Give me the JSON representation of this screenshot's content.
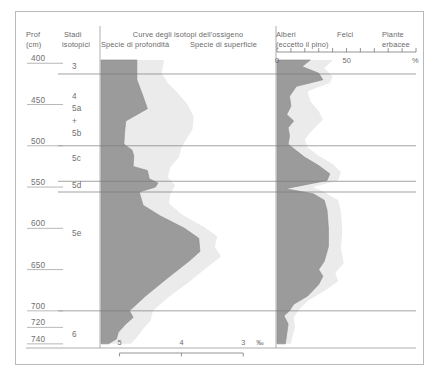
{
  "figure": {
    "columns": {
      "depth_header_line1": "Prof",
      "depth_header_line2": "(cm)",
      "stage_header_line1": "Stadi",
      "stage_header_line2": "isotopici",
      "isotope_title": "Curve degli isotopi dell'ossigeno",
      "isotope_sub_left": "Specie di profondità",
      "isotope_sub_right": "Specie di superficie",
      "pollen_header_1_line1": "Alberi",
      "pollen_header_1_line2": "(eccetto il pino)",
      "pollen_header_2": "Felci",
      "pollen_header_3_line1": "Piante",
      "pollen_header_3_line2": "erbacee"
    },
    "depth_labels": [
      "400",
      "450",
      "500",
      "550",
      "600",
      "650",
      "700",
      "720",
      "740"
    ],
    "stage_labels": [
      "3",
      "4",
      "5a",
      "+",
      "5b",
      "5c",
      "5d",
      "5e",
      "6"
    ],
    "isotope_axis": {
      "labels": [
        "5",
        "4",
        "3"
      ],
      "unit": "‰",
      "position": "bottom"
    },
    "pollen_axis": {
      "labels": [
        "0",
        "50"
      ],
      "unit": "%",
      "position": "top"
    },
    "colors": {
      "deep_species_fill": "#9b9b9b",
      "surface_species_fill": "#ebebeb",
      "frame": "#b9b9b9",
      "rule": "#7a7a7a",
      "text": "#6a6a6a"
    }
  },
  "chart_data": {
    "type": "area",
    "title": "Curve degli isotopi dell'ossigeno",
    "ylabel": "Prof (cm)",
    "ylim": [
      390,
      745
    ],
    "grid": false,
    "legend": "none",
    "panels": [
      {
        "name": "isotopi",
        "xlabel": "‰",
        "xlim": [
          5.3,
          2.6
        ],
        "xticks": [
          5,
          4,
          3
        ],
        "series": [
          {
            "name": "Specie di profondità",
            "fill": "#9b9b9b",
            "points": [
              {
                "depth": 396,
                "value": 4.72
              },
              {
                "depth": 420,
                "value": 4.72
              },
              {
                "depth": 440,
                "value": 4.62
              },
              {
                "depth": 455,
                "value": 4.55
              },
              {
                "depth": 470,
                "value": 4.9
              },
              {
                "depth": 485,
                "value": 4.92
              },
              {
                "depth": 498,
                "value": 4.93
              },
              {
                "depth": 505,
                "value": 4.8
              },
              {
                "depth": 512,
                "value": 4.77
              },
              {
                "depth": 525,
                "value": 4.78
              },
              {
                "depth": 530,
                "value": 4.55
              },
              {
                "depth": 540,
                "value": 4.52
              },
              {
                "depth": 545,
                "value": 4.38
              },
              {
                "depth": 550,
                "value": 4.42
              },
              {
                "depth": 556,
                "value": 4.68
              },
              {
                "depth": 562,
                "value": 4.66
              },
              {
                "depth": 572,
                "value": 4.62
              },
              {
                "depth": 585,
                "value": 4.34
              },
              {
                "depth": 600,
                "value": 3.95
              },
              {
                "depth": 612,
                "value": 3.72
              },
              {
                "depth": 628,
                "value": 3.7
              },
              {
                "depth": 640,
                "value": 3.88
              },
              {
                "depth": 660,
                "value": 4.22
              },
              {
                "depth": 682,
                "value": 4.58
              },
              {
                "depth": 700,
                "value": 4.84
              },
              {
                "depth": 708,
                "value": 4.78
              },
              {
                "depth": 716,
                "value": 4.9
              },
              {
                "depth": 726,
                "value": 5.02
              },
              {
                "depth": 734,
                "value": 5.05
              },
              {
                "depth": 740,
                "value": 5.18
              }
            ]
          },
          {
            "name": "Specie di superficie",
            "fill": "#ebebeb",
            "points": [
              {
                "depth": 396,
                "value": 4.28
              },
              {
                "depth": 412,
                "value": 4.32
              },
              {
                "depth": 424,
                "value": 4.22
              },
              {
                "depth": 436,
                "value": 4.06
              },
              {
                "depth": 450,
                "value": 3.9
              },
              {
                "depth": 465,
                "value": 3.8
              },
              {
                "depth": 480,
                "value": 3.82
              },
              {
                "depth": 492,
                "value": 3.92
              },
              {
                "depth": 502,
                "value": 4.0
              },
              {
                "depth": 514,
                "value": 4.04
              },
              {
                "depth": 526,
                "value": 4.18
              },
              {
                "depth": 538,
                "value": 4.22
              },
              {
                "depth": 548,
                "value": 4.1
              },
              {
                "depth": 558,
                "value": 4.18
              },
              {
                "depth": 570,
                "value": 4.2
              },
              {
                "depth": 584,
                "value": 3.98
              },
              {
                "depth": 598,
                "value": 3.64
              },
              {
                "depth": 610,
                "value": 3.42
              },
              {
                "depth": 622,
                "value": 3.46
              },
              {
                "depth": 634,
                "value": 3.36
              },
              {
                "depth": 648,
                "value": 3.6
              },
              {
                "depth": 664,
                "value": 3.86
              },
              {
                "depth": 684,
                "value": 4.22
              },
              {
                "depth": 700,
                "value": 4.46
              },
              {
                "depth": 712,
                "value": 4.5
              },
              {
                "depth": 722,
                "value": 4.62
              },
              {
                "depth": 732,
                "value": 4.72
              },
              {
                "depth": 740,
                "value": 4.82
              }
            ]
          }
        ]
      },
      {
        "name": "polline",
        "xlabel": "%",
        "xlim": [
          0,
          100
        ],
        "xticks": [
          0,
          10,
          20,
          30,
          40,
          50,
          60,
          70,
          80,
          90,
          100
        ],
        "series": [
          {
            "name": "Alberi (eccetto il pino)",
            "fill": "#9b9b9b",
            "points": [
              {
                "depth": 396,
                "value": 24
              },
              {
                "depth": 404,
                "value": 18
              },
              {
                "depth": 412,
                "value": 30
              },
              {
                "depth": 420,
                "value": 33
              },
              {
                "depth": 428,
                "value": 14
              },
              {
                "depth": 440,
                "value": 9
              },
              {
                "depth": 452,
                "value": 10
              },
              {
                "depth": 462,
                "value": 7
              },
              {
                "depth": 470,
                "value": 12
              },
              {
                "depth": 478,
                "value": 8
              },
              {
                "depth": 488,
                "value": 9
              },
              {
                "depth": 498,
                "value": 8
              },
              {
                "depth": 506,
                "value": 14
              },
              {
                "depth": 514,
                "value": 20
              },
              {
                "depth": 524,
                "value": 30
              },
              {
                "depth": 534,
                "value": 38
              },
              {
                "depth": 542,
                "value": 36
              },
              {
                "depth": 548,
                "value": 18
              },
              {
                "depth": 552,
                "value": 6
              },
              {
                "depth": 558,
                "value": 26
              },
              {
                "depth": 566,
                "value": 34
              },
              {
                "depth": 578,
                "value": 36
              },
              {
                "depth": 600,
                "value": 37
              },
              {
                "depth": 622,
                "value": 37
              },
              {
                "depth": 640,
                "value": 34
              },
              {
                "depth": 650,
                "value": 30
              },
              {
                "depth": 658,
                "value": 33
              },
              {
                "depth": 668,
                "value": 30
              },
              {
                "depth": 682,
                "value": 22
              },
              {
                "depth": 692,
                "value": 12
              },
              {
                "depth": 700,
                "value": 9
              },
              {
                "depth": 706,
                "value": 5
              },
              {
                "depth": 716,
                "value": 8
              },
              {
                "depth": 728,
                "value": 7
              },
              {
                "depth": 740,
                "value": 6
              }
            ]
          },
          {
            "name": "Felci",
            "fill": "#ebebeb",
            "points": [
              {
                "depth": 396,
                "value": 40
              },
              {
                "depth": 406,
                "value": 34
              },
              {
                "depth": 416,
                "value": 40
              },
              {
                "depth": 424,
                "value": 38
              },
              {
                "depth": 434,
                "value": 22
              },
              {
                "depth": 446,
                "value": 24
              },
              {
                "depth": 458,
                "value": 30
              },
              {
                "depth": 468,
                "value": 33
              },
              {
                "depth": 480,
                "value": 26
              },
              {
                "depth": 492,
                "value": 20
              },
              {
                "depth": 502,
                "value": 22
              },
              {
                "depth": 512,
                "value": 30
              },
              {
                "depth": 522,
                "value": 40
              },
              {
                "depth": 532,
                "value": 46
              },
              {
                "depth": 542,
                "value": 44
              },
              {
                "depth": 550,
                "value": 26
              },
              {
                "depth": 556,
                "value": 34
              },
              {
                "depth": 566,
                "value": 44
              },
              {
                "depth": 580,
                "value": 46
              },
              {
                "depth": 602,
                "value": 47
              },
              {
                "depth": 624,
                "value": 46
              },
              {
                "depth": 642,
                "value": 48
              },
              {
                "depth": 654,
                "value": 42
              },
              {
                "depth": 664,
                "value": 44
              },
              {
                "depth": 676,
                "value": 34
              },
              {
                "depth": 688,
                "value": 22
              },
              {
                "depth": 698,
                "value": 16
              },
              {
                "depth": 708,
                "value": 12
              },
              {
                "depth": 720,
                "value": 13
              },
              {
                "depth": 732,
                "value": 11
              },
              {
                "depth": 740,
                "value": 10
              }
            ]
          }
        ]
      }
    ],
    "boundaries": [
      {
        "depth": 413,
        "label": "3/4"
      },
      {
        "depth": 500,
        "label": "5b/5c"
      },
      {
        "depth": 543,
        "label": "5c/5d"
      },
      {
        "depth": 556,
        "label": "5d/5e"
      },
      {
        "depth": 700,
        "label": "5e/6"
      }
    ]
  }
}
